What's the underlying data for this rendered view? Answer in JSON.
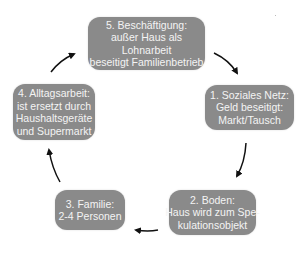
{
  "diagram": {
    "type": "cycle",
    "nodes": [
      {
        "id": "5",
        "lines": [
          "5. Beschäftigung:",
          "außer Haus als",
          "Lohnarbeit",
          "beseitigt Familienbetrieb"
        ]
      },
      {
        "id": "1",
        "lines": [
          "1. Soziales Netz:",
          "Geld beseitigt:",
          "Markt/Tausch"
        ]
      },
      {
        "id": "2",
        "lines": [
          "2. Boden:",
          "Haus wird zum Spe-",
          "kulationsobjekt"
        ]
      },
      {
        "id": "3",
        "lines": [
          "3. Familie:",
          "2-4 Personen"
        ]
      },
      {
        "id": "4",
        "lines": [
          "4. Alltagsarbeit:",
          "ist ersetzt durch",
          "Haushaltsgeräte",
          "und Supermarkt"
        ]
      }
    ],
    "edges": [
      {
        "from": "5",
        "to": "1"
      },
      {
        "from": "1",
        "to": "2"
      },
      {
        "from": "2",
        "to": "3"
      },
      {
        "from": "3",
        "to": "4"
      },
      {
        "from": "4",
        "to": "5"
      }
    ],
    "colors": {
      "box_fill": "#8a8a8a",
      "box_text": "#f4f4f4",
      "arrow": "#111111"
    }
  }
}
